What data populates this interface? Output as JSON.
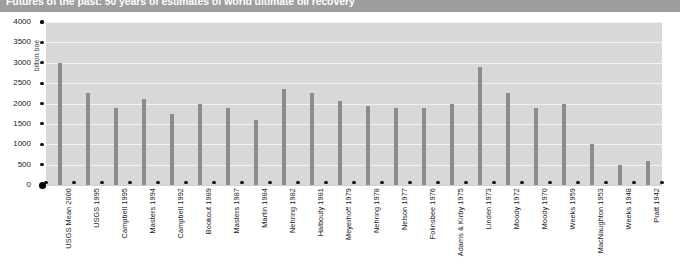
{
  "title": "Futures of the past: 50 years of estimates of world ultimate oil recovery",
  "chart_data": {
    "type": "bar",
    "title": "Futures of the past: 50 years of estimates of world ultimate oil recovery",
    "xlabel": "",
    "ylabel": "billion boe",
    "ylim": [
      0,
      4000
    ],
    "ytick_labels": [
      "0",
      "500",
      "1000",
      "1500",
      "2000",
      "2500",
      "3000",
      "3500",
      "4000"
    ],
    "ytick_values": [
      0,
      500,
      1000,
      1500,
      2000,
      2500,
      3000,
      3500,
      4000
    ],
    "grid": true,
    "legend": "none",
    "bar_color": "#8c8c8c",
    "plot_background": "#d8d8d8",
    "gridline_color": "#f2f2f2",
    "title_band_color": "#9e9e9e",
    "categories": [
      "USGS Mean 2000",
      "USGS 1995",
      "Campbell 1995",
      "Masters 1994",
      "Campbell 1992",
      "Bookout 1989",
      "Masters 1987",
      "Martin 1984",
      "Nehring 1982",
      "Halbouty 1981",
      "Meyerhoff 1979",
      "Nehring 1978",
      "Nelson 1977",
      "Folinsbee 1976",
      "Adams & Kirby 1975",
      "Linden 1973",
      "Moody 1972",
      "Moody 1970",
      "Weeks 1959",
      "MacNaughton 1953",
      "Weeks 1948",
      "Pratt 1942"
    ],
    "values": [
      3000,
      2250,
      1900,
      2100,
      1750,
      2000,
      1900,
      1600,
      2350,
      2250,
      2050,
      1950,
      1900,
      1900,
      2000,
      2900,
      2250,
      1900,
      2000,
      1000,
      500,
      580
    ]
  }
}
